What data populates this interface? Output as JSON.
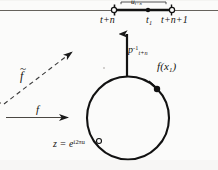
{
  "figure": {
    "background_color": "#fbfbfa",
    "ink_color": "#1a1a1a"
  },
  "labels": {
    "interval_bracket": {
      "base": "u",
      "sub": "t+n"
    },
    "axis_left_tick": "t+n",
    "axis_mid_tick": {
      "base": "t",
      "sub": "1"
    },
    "axis_right_tick": "t+n+1",
    "projection": {
      "base": "p",
      "sup": "-1",
      "sub": "t+n"
    },
    "circle_point": "f(x",
    "circle_point_sub": "1",
    "circle_point_close": ")",
    "lift_map": "f",
    "lift_map_accent": "~",
    "map": "f",
    "circle_param_lhs": "z = e",
    "circle_param_exp": "i2πu"
  },
  "geometry": {
    "axis": {
      "y": 10,
      "x_start": 0,
      "x_end": 218
    },
    "segment": {
      "x_start": 114,
      "x_end": 172,
      "y": 10
    },
    "endpoints": [
      {
        "name": "left-open-endpoint",
        "cx": 114,
        "cy": 10
      },
      {
        "name": "right-open-endpoint",
        "cx": 172,
        "cy": 10
      }
    ],
    "segment_dot": {
      "cx": 148,
      "cy": 10
    },
    "circle": {
      "cx": 128,
      "cy": 118,
      "r": 41
    },
    "circle_dot": {
      "cx": 156,
      "cy": 89
    },
    "circle_open_dot": {
      "cx": 99,
      "cy": 142
    },
    "vertical_arrow": {
      "x": 127,
      "y_from": 76,
      "y_to": 32
    },
    "dashed_arrow": {
      "x1": 8,
      "y1": 101,
      "x2": 78,
      "y2": 48
    },
    "solid_arrow": {
      "x1": 10,
      "y1": 117,
      "x2": 72,
      "y2": 117
    }
  }
}
